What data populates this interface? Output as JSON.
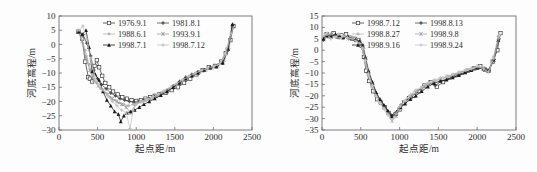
{
  "figure": {
    "background_color": "#fdfdfd",
    "axis_color": "#6f6f6f",
    "text_color": "#2b2b2b"
  },
  "chart_data": [
    {
      "type": "line",
      "panel": "left",
      "title": "",
      "xlabel": "起点距/m",
      "ylabel": "河底高程/m",
      "xlim": [
        0,
        2500
      ],
      "ylim": [
        -30,
        10
      ],
      "xticks": [
        0,
        500,
        1000,
        1500,
        2000,
        2500
      ],
      "yticks": [
        10,
        5,
        0,
        -5,
        -10,
        -15,
        -20,
        -25,
        -30
      ],
      "grid": false,
      "legend_position": "top-center",
      "legend_columns": 2,
      "series": [
        {
          "name": "1976.9.1",
          "marker": "open-square",
          "color": "#3a3a3a",
          "x": [
            250,
            300,
            340,
            380,
            400,
            430,
            460,
            490,
            520,
            560,
            600,
            650,
            700,
            760,
            820,
            880,
            940,
            1000,
            1060,
            1120,
            1180,
            1240,
            1300,
            1380,
            1460,
            1540,
            1620,
            1700,
            1780,
            1860,
            1940,
            2020,
            2100,
            2160,
            2220,
            2260
          ],
          "y": [
            4.5,
            2.0,
            -6.0,
            -11.5,
            -12.0,
            -13.0,
            -7.5,
            -5.5,
            -8.0,
            -11.0,
            -13.5,
            -15.0,
            -16.5,
            -17.5,
            -18.5,
            -19.0,
            -19.5,
            -19.8,
            -19.5,
            -19.0,
            -18.5,
            -18.0,
            -17.5,
            -17.0,
            -16.0,
            -15.0,
            -13.5,
            -12.0,
            -10.5,
            -9.0,
            -8.0,
            -7.5,
            -6.0,
            -3.0,
            1.5,
            6.5
          ]
        },
        {
          "name": "1981.8.1",
          "marker": "filled-cross",
          "color": "#4a4a4a",
          "x": [
            260,
            310,
            360,
            410,
            450,
            500,
            550,
            610,
            670,
            730,
            790,
            850,
            910,
            970,
            1030,
            1100,
            1170,
            1240,
            1320,
            1400,
            1480,
            1560,
            1640,
            1720,
            1800,
            1880,
            1960,
            2040,
            2120,
            2190,
            2250
          ],
          "y": [
            4.8,
            3.5,
            0.5,
            -4.0,
            -9.0,
            -12.0,
            -14.0,
            -15.5,
            -17.0,
            -18.0,
            -19.0,
            -19.5,
            -20.0,
            -20.2,
            -20.0,
            -19.5,
            -19.0,
            -18.2,
            -17.2,
            -16.0,
            -14.5,
            -13.0,
            -11.5,
            -10.5,
            -9.5,
            -8.8,
            -8.0,
            -7.5,
            -6.5,
            -2.0,
            7.0
          ]
        },
        {
          "name": "1988.6.1",
          "marker": "light-dot",
          "color": "#b4b4b4",
          "x": [
            240,
            290,
            340,
            390,
            440,
            490,
            540,
            600,
            660,
            720,
            780,
            840,
            900,
            960,
            1020,
            1080,
            1150,
            1220,
            1300,
            1380,
            1460,
            1540,
            1620,
            1700,
            1780,
            1860,
            1940,
            2020,
            2100,
            2170,
            2240
          ],
          "y": [
            5.0,
            2.5,
            -2.0,
            -7.0,
            -11.0,
            -13.5,
            -15.5,
            -17.0,
            -18.5,
            -19.5,
            -20.5,
            -21.0,
            -21.5,
            -21.0,
            -20.5,
            -20.0,
            -19.2,
            -18.5,
            -17.5,
            -16.5,
            -15.5,
            -14.0,
            -12.5,
            -11.0,
            -10.0,
            -9.0,
            -8.5,
            -7.8,
            -6.0,
            -1.5,
            5.5
          ]
        },
        {
          "name": "1993.9.1",
          "marker": "light-star",
          "color": "#9c9c9c",
          "x": [
            250,
            300,
            350,
            400,
            450,
            510,
            570,
            630,
            690,
            750,
            810,
            870,
            930,
            990,
            1050,
            1120,
            1190,
            1260,
            1340,
            1420,
            1500,
            1580,
            1660,
            1740,
            1820,
            1900,
            1980,
            2060,
            2140,
            2200,
            2255
          ],
          "y": [
            4.5,
            1.0,
            -4.5,
            -9.0,
            -12.5,
            -14.5,
            -16.0,
            -17.5,
            -19.0,
            -20.0,
            -21.0,
            -22.0,
            -24.0,
            -21.0,
            -20.0,
            -19.5,
            -19.0,
            -18.2,
            -17.0,
            -16.0,
            -14.8,
            -13.5,
            -12.0,
            -10.8,
            -9.8,
            -9.0,
            -8.2,
            -7.5,
            -5.5,
            -1.0,
            6.0
          ]
        },
        {
          "name": "1998.7.1",
          "marker": "filled-triangle",
          "color": "#1a1a1a",
          "x": [
            255,
            300,
            350,
            390,
            430,
            470,
            520,
            570,
            620,
            670,
            720,
            770,
            800,
            840,
            880,
            930,
            980,
            1040,
            1100,
            1170,
            1240,
            1320,
            1400,
            1480,
            1560,
            1640,
            1720,
            1800,
            1880,
            1960,
            2040,
            2120,
            2190,
            2245
          ],
          "y": [
            4.5,
            3.5,
            5.0,
            -1.0,
            -9.5,
            -10.5,
            -12.5,
            -16.5,
            -19.5,
            -21.5,
            -23.5,
            -24.5,
            -27.0,
            -25.0,
            -24.0,
            -23.5,
            -23.0,
            -22.0,
            -21.0,
            -20.0,
            -19.0,
            -17.8,
            -16.5,
            -15.0,
            -13.5,
            -12.0,
            -11.0,
            -10.0,
            -9.0,
            -8.2,
            -7.8,
            -6.5,
            -1.5,
            7.0
          ]
        },
        {
          "name": "1998.7.12",
          "marker": "light-plus",
          "color": "#c0c0c0",
          "x": [
            260,
            310,
            360,
            410,
            460,
            510,
            570,
            630,
            690,
            750,
            810,
            870,
            920,
            960,
            1000,
            1060,
            1130,
            1200,
            1280,
            1360,
            1440,
            1520,
            1600,
            1680,
            1760,
            1840,
            1920,
            2000,
            2080,
            2160,
            2230
          ],
          "y": [
            5.0,
            6.5,
            2.0,
            -5.0,
            -11.0,
            -14.0,
            -16.0,
            -18.0,
            -20.0,
            -21.5,
            -23.0,
            -24.0,
            -29.5,
            -23.0,
            -21.0,
            -20.2,
            -19.5,
            -18.8,
            -17.5,
            -16.2,
            -15.0,
            -13.8,
            -12.5,
            -11.2,
            -10.2,
            -9.2,
            -8.5,
            -7.8,
            -7.0,
            -3.5,
            4.0
          ]
        }
      ]
    },
    {
      "type": "line",
      "panel": "right",
      "title": "",
      "xlabel": "起点距/m",
      "ylabel": "河底高程/m",
      "xlim": [
        0,
        2500
      ],
      "ylim": [
        -35,
        15
      ],
      "xticks": [
        0,
        500,
        1000,
        1500,
        2000,
        2500
      ],
      "yticks": [
        15,
        10,
        5,
        0,
        -5,
        -10,
        -15,
        -20,
        -25,
        -30,
        -35
      ],
      "grid": false,
      "legend_position": "top-center",
      "legend_columns": 2,
      "series": [
        {
          "name": "1998.7.12",
          "marker": "open-square",
          "color": "#3a3a3a",
          "x": [
            10,
            60,
            110,
            150,
            200,
            250,
            310,
            360,
            420,
            470,
            510,
            540,
            570,
            610,
            660,
            710,
            760,
            810,
            860,
            900,
            950,
            1000,
            1060,
            1120,
            1180,
            1250,
            1320,
            1400,
            1480,
            1560,
            1640,
            1720,
            1800,
            1880,
            1960,
            2040,
            2100,
            2150,
            2200,
            2260,
            2300
          ],
          "y": [
            5.0,
            7.0,
            6.0,
            7.5,
            6.0,
            6.5,
            7.0,
            5.5,
            5.0,
            4.5,
            2.0,
            -3.0,
            -9.0,
            -13.5,
            -18.0,
            -21.5,
            -23.0,
            -25.0,
            -27.5,
            -29.0,
            -28.0,
            -26.0,
            -23.0,
            -21.0,
            -20.0,
            -18.0,
            -15.5,
            -14.0,
            -16.0,
            -14.0,
            -12.0,
            -11.0,
            -10.0,
            -9.0,
            -8.0,
            -7.0,
            -8.5,
            -9.0,
            -5.0,
            0.0,
            7.5
          ]
        },
        {
          "name": "1998.8.13",
          "marker": "filled-cross",
          "color": "#4a4a4a",
          "x": [
            20,
            70,
            120,
            170,
            220,
            280,
            330,
            390,
            440,
            490,
            530,
            560,
            600,
            650,
            700,
            750,
            800,
            850,
            900,
            960,
            1020,
            1080,
            1150,
            1220,
            1300,
            1380,
            1460,
            1540,
            1620,
            1700,
            1780,
            1860,
            1940,
            2020,
            2090,
            2150,
            2220,
            2280
          ],
          "y": [
            4.5,
            6.0,
            7.0,
            6.5,
            5.5,
            6.0,
            5.5,
            5.0,
            4.5,
            3.5,
            1.0,
            -4.0,
            -10.0,
            -15.0,
            -19.0,
            -22.0,
            -24.5,
            -27.0,
            -28.5,
            -27.0,
            -24.0,
            -22.0,
            -20.5,
            -18.5,
            -16.0,
            -14.5,
            -15.5,
            -13.5,
            -12.5,
            -11.5,
            -10.5,
            -9.5,
            -8.5,
            -7.5,
            -8.0,
            -9.0,
            -4.0,
            5.0
          ]
        },
        {
          "name": "1998.8.27",
          "marker": "light-dot",
          "color": "#b8b8b8",
          "x": [
            15,
            65,
            115,
            165,
            215,
            270,
            320,
            380,
            430,
            480,
            520,
            555,
            595,
            640,
            690,
            740,
            790,
            840,
            890,
            940,
            1000,
            1060,
            1130,
            1200,
            1280,
            1360,
            1440,
            1520,
            1600,
            1680,
            1760,
            1840,
            1920,
            2000,
            2080,
            2140,
            2210,
            2270
          ],
          "y": [
            6.0,
            7.5,
            5.5,
            6.5,
            7.0,
            5.0,
            6.0,
            5.5,
            4.0,
            3.0,
            0.5,
            -5.0,
            -11.0,
            -16.0,
            -20.0,
            -23.0,
            -25.5,
            -28.0,
            -30.0,
            -28.5,
            -25.0,
            -22.5,
            -20.0,
            -18.0,
            -16.5,
            -15.0,
            -14.0,
            -13.0,
            -12.0,
            -11.0,
            -10.0,
            -9.5,
            -8.5,
            -7.5,
            -8.5,
            -9.5,
            -3.0,
            6.0
          ]
        },
        {
          "name": "1998.9.8",
          "marker": "light-star",
          "color": "#a6a6a6",
          "x": [
            25,
            75,
            125,
            180,
            230,
            285,
            340,
            395,
            445,
            495,
            535,
            565,
            605,
            655,
            705,
            755,
            805,
            855,
            905,
            955,
            1015,
            1075,
            1145,
            1215,
            1290,
            1370,
            1450,
            1530,
            1610,
            1690,
            1770,
            1850,
            1930,
            2010,
            2085,
            2145,
            2215,
            2275
          ],
          "y": [
            5.5,
            6.5,
            7.0,
            6.0,
            5.5,
            6.5,
            5.0,
            5.5,
            4.5,
            3.5,
            1.5,
            -3.5,
            -9.5,
            -14.5,
            -19.5,
            -22.5,
            -25.0,
            -27.5,
            -31.0,
            -29.0,
            -25.5,
            -23.0,
            -20.5,
            -18.5,
            -17.0,
            -15.0,
            -13.5,
            -12.5,
            -11.5,
            -11.0,
            -10.0,
            -9.0,
            -8.0,
            -7.0,
            -8.0,
            -9.2,
            -4.5,
            5.5
          ]
        },
        {
          "name": "1998.9.16",
          "marker": "filled-triangle",
          "color": "#1a1a1a",
          "x": [
            18,
            68,
            118,
            175,
            225,
            275,
            335,
            385,
            435,
            485,
            525,
            558,
            598,
            648,
            698,
            748,
            798,
            848,
            898,
            948,
            1010,
            1070,
            1140,
            1210,
            1285,
            1365,
            1445,
            1525,
            1605,
            1685,
            1765,
            1845,
            1925,
            2005,
            2080,
            2142,
            2212,
            2272
          ],
          "y": [
            5.0,
            6.5,
            6.0,
            7.0,
            6.5,
            5.5,
            6.0,
            5.0,
            4.5,
            4.0,
            2.0,
            -3.0,
            -9.0,
            -14.0,
            -18.5,
            -21.5,
            -24.0,
            -26.5,
            -29.0,
            -28.0,
            -25.0,
            -23.5,
            -21.5,
            -20.0,
            -18.0,
            -16.0,
            -14.5,
            -13.5,
            -13.0,
            -12.0,
            -11.0,
            -9.8,
            -8.8,
            -7.8,
            -8.2,
            -9.0,
            -4.2,
            4.5
          ]
        },
        {
          "name": "1998.9.24",
          "marker": "light-plus",
          "color": "#c4c4c4",
          "x": [
            12,
            62,
            112,
            168,
            218,
            268,
            330,
            388,
            438,
            488,
            528,
            562,
            602,
            652,
            702,
            752,
            802,
            852,
            902,
            952,
            1012,
            1072,
            1142,
            1212,
            1288,
            1368,
            1448,
            1528,
            1608,
            1688,
            1768,
            1848,
            1928,
            2008,
            2082,
            2144,
            2214,
            2290
          ],
          "y": [
            6.5,
            7.0,
            5.0,
            6.0,
            7.0,
            6.0,
            5.5,
            5.0,
            4.0,
            3.0,
            1.0,
            -4.5,
            -10.5,
            -15.5,
            -20.5,
            -23.5,
            -26.0,
            -28.5,
            -30.5,
            -28.0,
            -24.5,
            -22.0,
            -19.5,
            -17.5,
            -16.0,
            -14.2,
            -13.0,
            -12.0,
            -11.5,
            -10.5,
            -9.5,
            -8.8,
            -8.2,
            -7.2,
            -8.2,
            -9.5,
            -3.5,
            7.0
          ]
        }
      ]
    }
  ]
}
